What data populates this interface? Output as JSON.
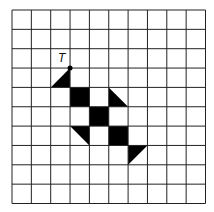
{
  "diagram": {
    "grid": {
      "cols": 10,
      "rows": 10,
      "x0": 12,
      "y0": 10,
      "cell": 19.35,
      "line_color": "#222222"
    },
    "point_label": "T",
    "point": {
      "col": 3,
      "row": 3
    },
    "fill_color": "#000000",
    "squares": [
      {
        "col": 3,
        "row": 4
      },
      {
        "col": 4,
        "row": 5
      },
      {
        "col": 5,
        "row": 6
      }
    ],
    "triangles": [
      {
        "cell": [
          2,
          3
        ],
        "corners": [
          "TR",
          "BL",
          "BR"
        ]
      },
      {
        "cell": [
          5,
          4
        ],
        "corners": [
          "TL",
          "BR",
          "BL"
        ]
      },
      {
        "cell": [
          3,
          6
        ],
        "corners": [
          "TL",
          "TR",
          "BR"
        ]
      },
      {
        "cell": [
          6,
          7
        ],
        "corners": [
          "TL",
          "TR",
          "BL"
        ]
      }
    ]
  }
}
